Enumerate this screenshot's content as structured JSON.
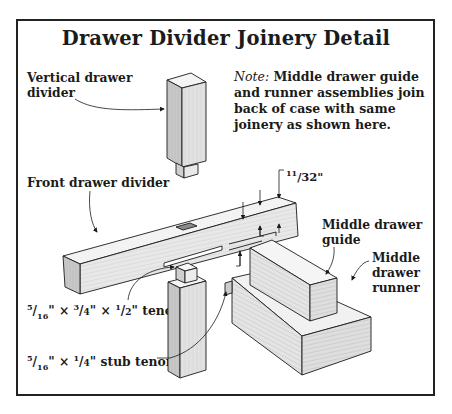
{
  "title": "Drawer Divider Joinery Detail",
  "note": {
    "label": "Note:",
    "lines": [
      "Middle drawer guide",
      "and runner assemblies join",
      "back of case with same",
      "joinery as shown here."
    ]
  },
  "labels": {
    "vertical_divider": [
      "Vertical drawer",
      "divider"
    ],
    "front_divider": "Front drawer divider",
    "middle_guide": [
      "Middle drawer",
      "guide"
    ],
    "middle_runner": [
      "Middle",
      "drawer",
      "runner"
    ],
    "tenon": {
      "parts": [
        {
          "num": "5",
          "den": "16",
          "unit": "\""
        },
        {
          "num": "3",
          "den": "4",
          "unit": "\""
        },
        {
          "num": "1",
          "den": "2",
          "unit": "\""
        }
      ],
      "separator": "×",
      "suffix": "tenon"
    },
    "stub_tenon": {
      "parts": [
        {
          "num": "5",
          "den": "16",
          "unit": "\""
        },
        {
          "num": "1",
          "den": "4",
          "unit": "\""
        }
      ],
      "separator": "×",
      "suffix": "stub tenon"
    }
  },
  "dimensions": {
    "top_offset": {
      "whole": "11",
      "frac": "/32\""
    },
    "bottom_offset": {
      "whole": "11",
      "frac": "/32\""
    },
    "groove_width": {
      "num": "5",
      "frac": "/16\""
    }
  },
  "colors": {
    "ink": "#1b1b1b",
    "wood_light": "#efefef",
    "wood_mid": "#dcdcdc",
    "wood_dark": "#c4c4c4",
    "frame": "#222222"
  }
}
